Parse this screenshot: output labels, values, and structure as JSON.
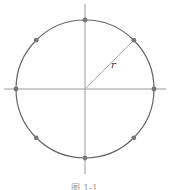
{
  "diagram": {
    "type": "circle-with-axes",
    "center": [
      85,
      89
    ],
    "radius_px": 69,
    "radius_label": "r",
    "points_count": 8,
    "point_angles_deg": [
      0,
      45,
      90,
      135,
      180,
      225,
      270,
      315
    ],
    "radius_angle_deg": 45,
    "colors": {
      "circle": "#666666",
      "axes": "#999999",
      "radius": "#aaaaaa",
      "points": "#777777"
    }
  },
  "caption": "图 1-1"
}
